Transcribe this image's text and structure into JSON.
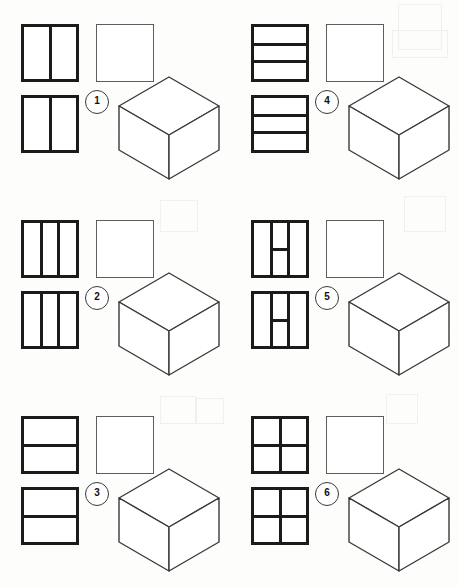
{
  "page": {
    "background_color": "#fdfdfc",
    "ink_color": "#1b1b1b",
    "thin_line_color": "#5d5d5d",
    "width": 459,
    "height": 587,
    "columns": 2,
    "rows": 3
  },
  "items": [
    {
      "number": "1",
      "pattern_name": "two-vertical-halves",
      "pattern_description": "Square divided into 2 equal vertical halves by one vertical line",
      "vertical_lines_percent": [
        50
      ],
      "horizontal_lines_percent": [],
      "horizontal_segments": [],
      "pattern_square_count": 2,
      "blank_square_count": 1,
      "cube_count": 1
    },
    {
      "number": "2",
      "pattern_name": "three-vertical-thirds",
      "pattern_description": "Square divided into 3 equal vertical columns by two vertical lines",
      "vertical_lines_percent": [
        33.3,
        66.6
      ],
      "horizontal_lines_percent": [],
      "horizontal_segments": [],
      "pattern_square_count": 2,
      "blank_square_count": 1,
      "cube_count": 1
    },
    {
      "number": "3",
      "pattern_name": "two-horizontal-halves",
      "pattern_description": "Square divided into 2 equal horizontal rows by one horizontal line",
      "vertical_lines_percent": [],
      "horizontal_lines_percent": [
        50
      ],
      "horizontal_segments": [],
      "pattern_square_count": 2,
      "blank_square_count": 1,
      "cube_count": 1
    },
    {
      "number": "4",
      "pattern_name": "three-horizontal-thirds",
      "pattern_description": "Square divided into 3 equal horizontal rows by two horizontal lines",
      "vertical_lines_percent": [],
      "horizontal_lines_percent": [
        33.3,
        66.6
      ],
      "horizontal_segments": [],
      "pattern_square_count": 2,
      "blank_square_count": 1,
      "cube_count": 1
    },
    {
      "number": "5",
      "pattern_name": "h-shape",
      "pattern_description": "Two vertical lines at thirds joined by a horizontal bar across the middle column, forming a letter H",
      "vertical_lines_percent": [
        33.3,
        66.6
      ],
      "horizontal_lines_percent": [],
      "horizontal_segments": [
        {
          "left_percent": 33.3,
          "right_percent": 66.6,
          "top_percent": 50
        }
      ],
      "pattern_square_count": 2,
      "blank_square_count": 1,
      "cube_count": 1
    },
    {
      "number": "6",
      "pattern_name": "two-by-two-quadrants",
      "pattern_description": "Square divided into 4 equal quadrants by one vertical and one horizontal line",
      "vertical_lines_percent": [
        50
      ],
      "horizontal_lines_percent": [
        50
      ],
      "horizontal_segments": [],
      "pattern_square_count": 2,
      "blank_square_count": 1,
      "cube_count": 1
    }
  ],
  "cube": {
    "name": "isometric-cube",
    "description": "Hexagonal outline isometric cube showing top, left and right faces",
    "stroke_color": "#3a3a3a",
    "fill_color": "#ffffff"
  }
}
